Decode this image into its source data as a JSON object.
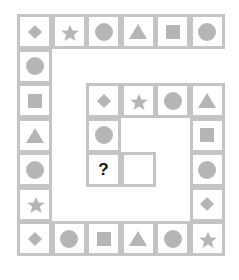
{
  "puzzle": {
    "type": "spiral-shape-sequence",
    "colors": {
      "border": "#c4c4c4",
      "shape": "#b5b5b5",
      "question": "#111111"
    },
    "cells": [
      {
        "row": 0,
        "col": 0,
        "shape": "diamond"
      },
      {
        "row": 0,
        "col": 1,
        "shape": "star"
      },
      {
        "row": 0,
        "col": 2,
        "shape": "circle"
      },
      {
        "row": 0,
        "col": 3,
        "shape": "triangle"
      },
      {
        "row": 0,
        "col": 4,
        "shape": "square"
      },
      {
        "row": 0,
        "col": 5,
        "shape": "circle"
      },
      {
        "row": 1,
        "col": 0,
        "shape": "circle"
      },
      {
        "row": 2,
        "col": 0,
        "shape": "square"
      },
      {
        "row": 3,
        "col": 0,
        "shape": "triangle"
      },
      {
        "row": 4,
        "col": 0,
        "shape": "circle"
      },
      {
        "row": 5,
        "col": 0,
        "shape": "star"
      },
      {
        "row": 6,
        "col": 0,
        "shape": "diamond"
      },
      {
        "row": 6,
        "col": 1,
        "shape": "circle"
      },
      {
        "row": 6,
        "col": 2,
        "shape": "square"
      },
      {
        "row": 6,
        "col": 3,
        "shape": "triangle"
      },
      {
        "row": 6,
        "col": 4,
        "shape": "circle"
      },
      {
        "row": 6,
        "col": 5,
        "shape": "star"
      },
      {
        "row": 5,
        "col": 5,
        "shape": "diamond"
      },
      {
        "row": 4,
        "col": 5,
        "shape": "circle"
      },
      {
        "row": 3,
        "col": 5,
        "shape": "square"
      },
      {
        "row": 2,
        "col": 5,
        "shape": "triangle"
      },
      {
        "row": 2,
        "col": 4,
        "shape": "circle"
      },
      {
        "row": 2,
        "col": 3,
        "shape": "star"
      },
      {
        "row": 2,
        "col": 2,
        "shape": "diamond"
      },
      {
        "row": 3,
        "col": 2,
        "shape": "circle"
      },
      {
        "row": 4,
        "col": 2,
        "shape": "question",
        "text": "?"
      },
      {
        "row": 4,
        "col": 3,
        "shape": "empty"
      }
    ]
  }
}
